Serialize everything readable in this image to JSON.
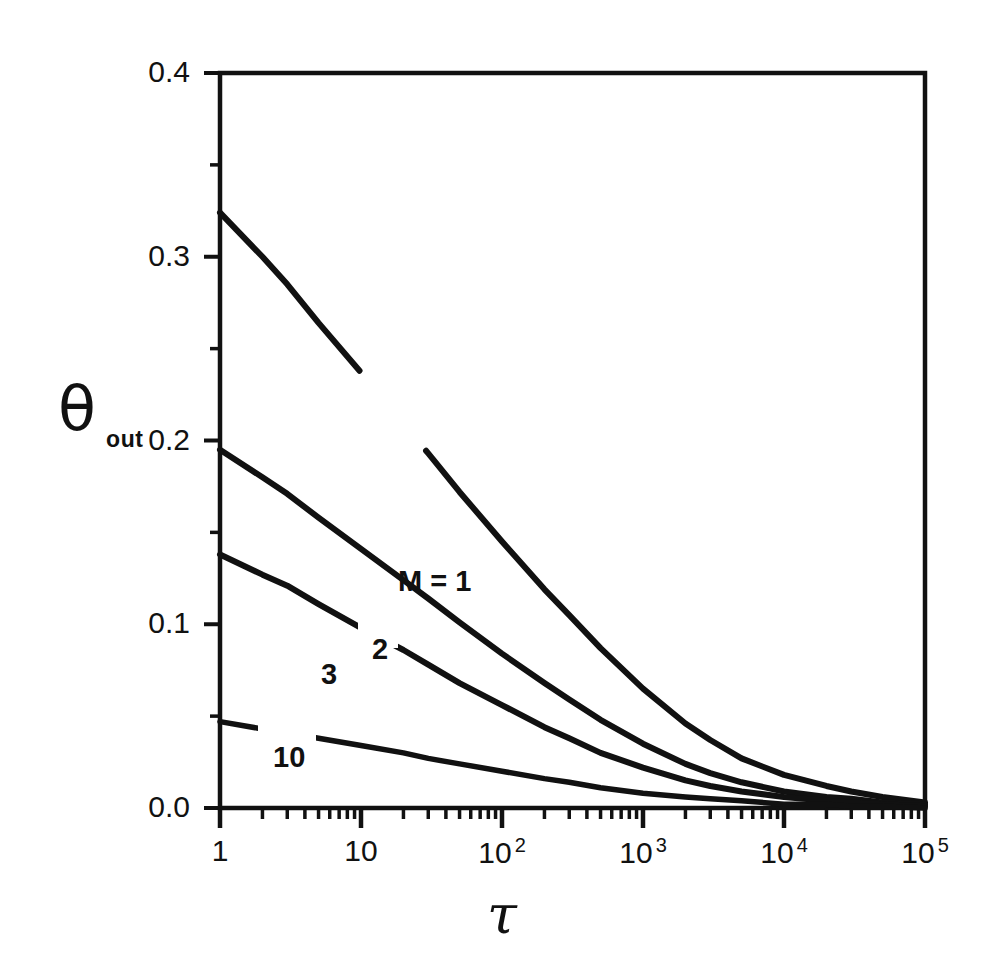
{
  "figure": {
    "background": "#ffffff",
    "ink_color": "#111111",
    "frame": {
      "left": 220,
      "top": 73,
      "right": 925,
      "bottom": 808
    }
  },
  "axis_titles": {
    "y_symbol": "θ",
    "y_subscript": "out",
    "x_symbol": "τ"
  },
  "y_ticks": [
    {
      "label": "0.0",
      "value": 0.0
    },
    {
      "label": "0.1",
      "value": 0.1
    },
    {
      "label": "0.2",
      "value": 0.2
    },
    {
      "label": "0.3",
      "value": 0.3
    },
    {
      "label": "0.4",
      "value": 0.4
    }
  ],
  "y_minor_values": [
    0.05,
    0.15,
    0.25,
    0.35
  ],
  "x_ticks": [
    {
      "base": "1",
      "exp": "",
      "value": 1
    },
    {
      "base": "10",
      "exp": "",
      "value": 10
    },
    {
      "base": "10",
      "exp": "2",
      "value": 100
    },
    {
      "base": "10",
      "exp": "3",
      "value": 1000
    },
    {
      "base": "10",
      "exp": "4",
      "value": 10000
    },
    {
      "base": "10",
      "exp": "5",
      "value": 100000
    }
  ],
  "curve_labels": [
    {
      "text": "M = 1",
      "x_px": 398,
      "y_px": 565
    },
    {
      "text": "2",
      "x_px": 372,
      "y_px": 633
    },
    {
      "text": "3",
      "x_px": 321,
      "y_px": 658
    },
    {
      "text": "10",
      "x_px": 273,
      "y_px": 741
    }
  ],
  "chart_data": {
    "type": "line",
    "title": "",
    "xlabel": "τ",
    "ylabel": "θ_out",
    "xscale": "log",
    "yscale": "linear",
    "xlim": [
      1,
      100000
    ],
    "ylim": [
      0.0,
      0.4
    ],
    "grid": false,
    "legend": "inline curve labels",
    "x": [
      1,
      2,
      3,
      5,
      10,
      20,
      30,
      50,
      100,
      200,
      300,
      500,
      1000,
      2000,
      3000,
      5000,
      10000,
      20000,
      30000,
      50000,
      100000
    ],
    "series": [
      {
        "name": "M = 1",
        "label": "M = 1",
        "values": [
          0.324,
          0.3,
          0.285,
          0.264,
          0.237,
          0.209,
          0.193,
          0.172,
          0.145,
          0.119,
          0.105,
          0.087,
          0.065,
          0.046,
          0.037,
          0.027,
          0.018,
          0.012,
          0.009,
          0.006,
          0.003
        ]
      },
      {
        "name": "M = 2",
        "label": "2",
        "values": [
          0.195,
          0.18,
          0.171,
          0.158,
          0.141,
          0.124,
          0.114,
          0.101,
          0.084,
          0.068,
          0.059,
          0.048,
          0.035,
          0.024,
          0.019,
          0.014,
          0.009,
          0.006,
          0.005,
          0.003,
          0.002
        ]
      },
      {
        "name": "M = 3",
        "label": "3",
        "values": [
          0.138,
          0.127,
          0.121,
          0.111,
          0.098,
          0.086,
          0.078,
          0.068,
          0.056,
          0.044,
          0.038,
          0.03,
          0.022,
          0.015,
          0.012,
          0.009,
          0.006,
          0.004,
          0.003,
          0.002,
          0.001
        ]
      },
      {
        "name": "M = 10",
        "label": "10",
        "values": [
          0.047,
          0.043,
          0.041,
          0.038,
          0.034,
          0.03,
          0.027,
          0.024,
          0.02,
          0.016,
          0.014,
          0.011,
          0.008,
          0.006,
          0.005,
          0.004,
          0.002,
          0.002,
          0.001,
          0.001,
          0.0
        ]
      }
    ]
  }
}
